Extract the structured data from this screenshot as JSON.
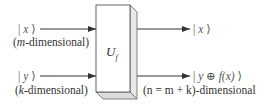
{
  "diagram": {
    "gate": {
      "label": "U",
      "subscript": "f"
    },
    "inputs": [
      {
        "ket": "| x ⟩",
        "ket_var": "x",
        "dimension_label": "(m-dimensional)",
        "dim_var": "m",
        "dim_rest": "-dimensional)"
      },
      {
        "ket": "| y ⟩",
        "ket_var": "y",
        "dimension_label": "(k-dimensional)",
        "dim_var": "k",
        "dim_rest": "-dimensional)"
      }
    ],
    "outputs": [
      {
        "ket": "| x ⟩",
        "ket_var": "x"
      },
      {
        "ket": "| y ⊕ f(x) ⟩",
        "ket_expr": "y ⊕ f(x)",
        "dimension_label": "(n = m + k)-dimensional"
      }
    ],
    "colors": {
      "line": "#333333",
      "box_front": "#ffffff",
      "box_side": "#e6e6e6",
      "box_edge": "#555555"
    }
  }
}
